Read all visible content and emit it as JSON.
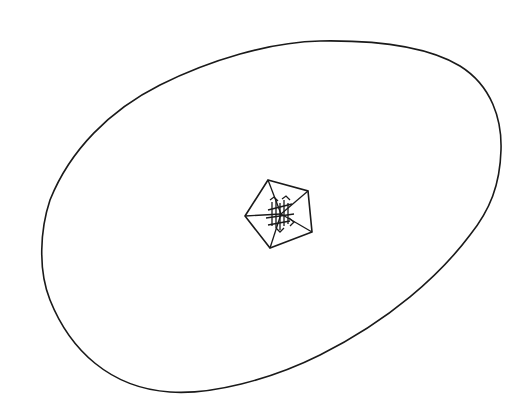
{
  "diagram": {
    "type": "line-drawing",
    "background": "#ffffff",
    "stroke_color": "#1a1a1a",
    "outer_shape": {
      "kind": "egg-shaped closed outline",
      "stroke_width": 1.6
    },
    "inner_shape": {
      "kind": "pentagon with spokes to center",
      "vertices": [
        [
          268,
          180
        ],
        [
          308,
          191
        ],
        [
          312,
          232
        ],
        [
          270,
          248
        ],
        [
          245,
          216
        ]
      ],
      "center": [
        281,
        214
      ],
      "stroke_width": 1.6,
      "center_marking": "hatched arrow glyphs"
    }
  }
}
